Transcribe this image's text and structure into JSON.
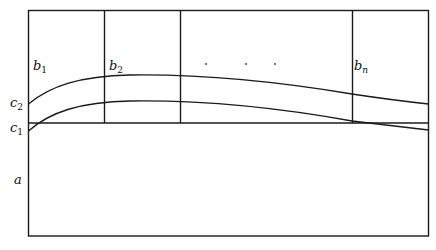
{
  "diagram": {
    "type": "schematic",
    "stroke_color": "#1a1a1a",
    "background": "#ffffff",
    "regions": {
      "a": {
        "base": "a",
        "sub": ""
      },
      "c1": {
        "base": "c",
        "sub": "1"
      },
      "c2": {
        "base": "c",
        "sub": "2"
      },
      "b1": {
        "base": "b",
        "sub": "1"
      },
      "b2": {
        "base": "b",
        "sub": "2"
      },
      "bn": {
        "base": "b",
        "sub": "n"
      }
    },
    "ellipsis_dots": [
      ". ",
      ". ",
      "."
    ],
    "elements": {
      "outer_box": "rectangle",
      "column_dividers": 3,
      "horizontal_divider": "line",
      "upper_curve": "c2 boundary",
      "lower_curve": "c1 boundary"
    }
  }
}
